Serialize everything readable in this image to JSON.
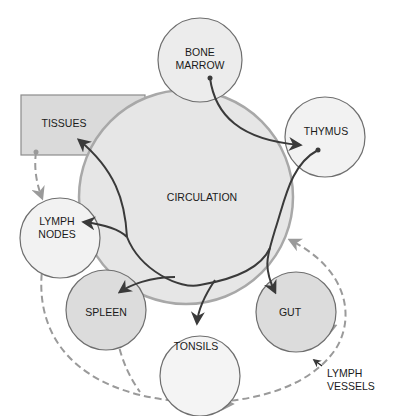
{
  "diagram": {
    "colors": {
      "background": "#ffffff",
      "circulation_fill": "#e6e6e6",
      "circulation_stroke": "#a8a8a8",
      "organ_fill_light": "#f2f2f2",
      "organ_fill_dark": "#dcdcdc",
      "organ_stroke": "#6e6e6e",
      "tissues_fill": "#dadada",
      "tissues_stroke": "#8c8c8c",
      "solid_arrow": "#3a3a3a",
      "dashed_arrow": "#9a9a9a",
      "text": "#1a1a1a"
    },
    "nodes": {
      "circulation": {
        "label": "CIRCULATION"
      },
      "bone_marrow": {
        "label_line1": "BONE",
        "label_line2": "MARROW"
      },
      "thymus": {
        "label": "THYMUS"
      },
      "tissues": {
        "label": "TISSUES"
      },
      "lymph_nodes": {
        "label_line1": "LYMPH",
        "label_line2": "NODES"
      },
      "spleen": {
        "label": "SPLEEN"
      },
      "tonsils": {
        "label": "TONSILS"
      },
      "gut": {
        "label": "GUT"
      }
    },
    "annotation": {
      "label_line1": "LYMPH",
      "label_line2": "VESSELS"
    },
    "edges": [
      {
        "from": "BONE MARROW",
        "to": "THYMUS",
        "style": "solid"
      },
      {
        "from": "THYMUS",
        "to": "GUT",
        "style": "solid",
        "via": "CIRCULATION"
      },
      {
        "from": "CIRCULATION",
        "to": "TISSUES",
        "style": "solid"
      },
      {
        "from": "CIRCULATION",
        "to": "LYMPH NODES",
        "style": "solid"
      },
      {
        "from": "CIRCULATION",
        "to": "SPLEEN",
        "style": "solid"
      },
      {
        "from": "CIRCULATION",
        "to": "TONSILS",
        "style": "solid"
      },
      {
        "from": "TISSUES",
        "to": "LYMPH NODES",
        "style": "dashed"
      },
      {
        "from": "LYMPH NODES",
        "to": "CIRCULATION",
        "style": "dashed",
        "label": "LYMPH VESSELS"
      },
      {
        "from": "SPLEEN",
        "to": "CIRCULATION",
        "style": "dashed"
      },
      {
        "from": "TONSILS",
        "to": "CIRCULATION",
        "style": "dashed"
      },
      {
        "from": "GUT",
        "to": "CIRCULATION",
        "style": "dashed"
      }
    ]
  }
}
